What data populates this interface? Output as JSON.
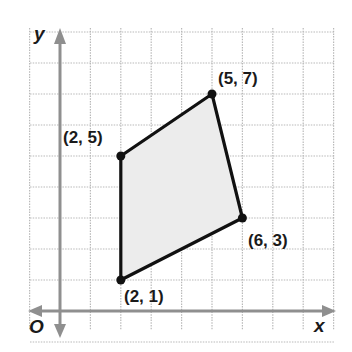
{
  "diagram": {
    "type": "coordinate-plane-polygon",
    "axes": {
      "x_label": "x",
      "y_label": "y",
      "origin_label": "O"
    },
    "grid": {
      "x_range": [
        -1,
        9
      ],
      "y_range": [
        -1,
        9
      ],
      "step": 1,
      "style": "dotted"
    },
    "polygon": {
      "fill": "#ececec",
      "stroke": "#111111",
      "vertices": [
        {
          "x": 2,
          "y": 1,
          "label": "(2, 1)"
        },
        {
          "x": 2,
          "y": 5,
          "label": "(2, 5)"
        },
        {
          "x": 5,
          "y": 7,
          "label": "(5, 7)"
        },
        {
          "x": 6,
          "y": 3,
          "label": "(6, 3)"
        }
      ]
    }
  }
}
